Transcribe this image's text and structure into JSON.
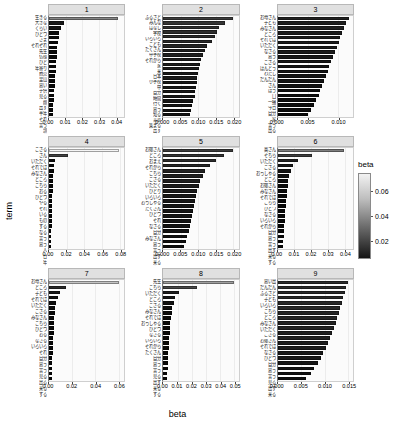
{
  "chart_data": {
    "type": "bar",
    "title": "",
    "xlabel": "beta",
    "ylabel": "term",
    "orientation": "horizontal",
    "facet_variable": "topic",
    "legend": {
      "title": "beta",
      "position": "right",
      "type": "continuous-colorbar",
      "ticks": [
        0.02,
        0.04,
        0.06
      ],
      "tick_labels": [
        "0.02",
        "0.04",
        "0.06"
      ],
      "low_color": "#000000",
      "high_color": "#ffffff",
      "range": [
        0.005,
        0.075
      ]
    },
    "panels": [
      {
        "label": "1",
        "xlim": [
          0,
          0.045
        ],
        "ticks": [
          0,
          0.01,
          0.02,
          0.03,
          0.04
        ],
        "tick_labels": [
          "0.00",
          "0.01",
          "0.02",
          "0.03",
          "0.04"
        ],
        "categories": [
          "生きる",
          "大きな",
          "くらい",
          "ひとつ",
          "さま",
          "それぞれ",
          "先生",
          "仏様",
          "ひと",
          "年寄り",
          "商売",
          "里山",
          "思い",
          "子供",
          "見る",
          "顔",
          "出す",
          "半年",
          "それ",
          "言う",
          "頭"
        ],
        "values": [
          0.0415,
          0.0092,
          0.0072,
          0.0062,
          0.0057,
          0.0053,
          0.005,
          0.0047,
          0.0045,
          0.0043,
          0.0041,
          0.0039,
          0.0037,
          0.0035,
          0.0033,
          0.0031,
          0.0029,
          0.0028,
          0.0026,
          0.0025,
          0.0024
        ]
      },
      {
        "label": "2",
        "xlim": [
          0,
          0.0215
        ],
        "ticks": [
          0,
          0.005,
          0.01,
          0.015,
          0.02
        ],
        "tick_labels": [
          "0.000",
          "0.005",
          "0.010",
          "0.015",
          "0.020"
        ],
        "categories": [
          "ふるさと",
          "みんな",
          "はなし",
          "学校",
          "いろいろ",
          "こども",
          "たくさん",
          "中学校",
          "それから",
          "家",
          "来",
          "日本",
          "小学校",
          "中",
          "自分",
          "時間",
          "行く",
          "思う",
          "知る",
          "言葉",
          "集まる",
          "出す"
        ],
        "values": [
          0.02,
          0.0177,
          0.016,
          0.0152,
          0.0148,
          0.014,
          0.0125,
          0.0118,
          0.0112,
          0.0108,
          0.0104,
          0.0101,
          0.0099,
          0.0097,
          0.0095,
          0.0093,
          0.0091,
          0.0089,
          0.0086,
          0.0083,
          0.008,
          0.0077
        ]
      },
      {
        "label": "3",
        "xlim": [
          0,
          0.0125
        ],
        "ticks": [
          0,
          0.005,
          0.01
        ],
        "tick_labels": [
          "0.000",
          "0.005",
          "0.010"
        ],
        "categories": [
          "お母さん",
          "子ども",
          "みなさん",
          "ところ",
          "それでは",
          "いただく",
          "なさる",
          "思う",
          "ござる",
          "ほんとう",
          "わたし",
          "だんだん",
          "さん",
          "ほう",
          "口",
          "一緒",
          "今日",
          "自分",
          "家",
          "言う",
          "出る"
        ],
        "values": [
          0.0118,
          0.0114,
          0.011,
          0.0107,
          0.0104,
          0.0101,
          0.0098,
          0.0095,
          0.0092,
          0.0089,
          0.0086,
          0.0083,
          0.008,
          0.0077,
          0.0074,
          0.0071,
          0.0068,
          0.0064,
          0.006,
          0.0055,
          0.005
        ]
      },
      {
        "label": "4",
        "xlim": [
          0,
          0.085
        ],
        "ticks": [
          0,
          0.02,
          0.04,
          0.06,
          0.08
        ],
        "tick_labels": [
          "0.00",
          "0.02",
          "0.04",
          "0.06",
          "0.08"
        ],
        "categories": [
          "ござる",
          "さん",
          "いただく",
          "それでは",
          "みなさん",
          "ところ",
          "こちら",
          "おる",
          "ひとつ",
          "やる",
          "それ",
          "いる",
          "もの",
          "する",
          "なる",
          "言う",
          "思う",
          "人",
          "日",
          "年"
        ],
        "values": [
          0.079,
          0.0215,
          0.0072,
          0.0058,
          0.0051,
          0.0047,
          0.0044,
          0.0042,
          0.004,
          0.0038,
          0.0036,
          0.0034,
          0.0033,
          0.0031,
          0.003,
          0.0029,
          0.0028,
          0.0027,
          0.0026,
          0.0025
        ]
      },
      {
        "label": "5",
        "xlim": [
          0,
          0.0215
        ],
        "ticks": [
          0,
          0.005,
          0.01,
          0.015,
          0.02
        ],
        "tick_labels": [
          "0.000",
          "0.005",
          "0.010",
          "0.015",
          "0.020"
        ],
        "categories": [
          "お嬢さん",
          "ところ",
          "おまえ",
          "それから",
          "こちら",
          "ござる",
          "いただく",
          "ひとり",
          "いろいろ",
          "おっしゃる",
          "たくさん",
          "ひとつ",
          "それ",
          "なさる",
          "自分",
          "みなさん",
          "思う",
          "言う",
          "出す",
          "来る"
        ],
        "values": [
          0.02,
          0.0172,
          0.015,
          0.0132,
          0.012,
          0.0112,
          0.0106,
          0.0101,
          0.0097,
          0.0093,
          0.009,
          0.0087,
          0.0084,
          0.0081,
          0.0078,
          0.0075,
          0.0072,
          0.0068,
          0.0064,
          0.0058
        ]
      },
      {
        "label": "6",
        "xlim": [
          0,
          0.045
        ],
        "ticks": [
          0,
          0.01,
          0.02,
          0.03,
          0.04
        ],
        "tick_labels": [
          "0.00",
          "0.01",
          "0.02",
          "0.03",
          "0.04"
        ],
        "categories": [
          "奥さん",
          "そちら",
          "いただく",
          "ござる",
          "おっしゃる",
          "ところ",
          "お嬢さん",
          "みなさん",
          "それでは",
          "こちら",
          "ひとつ",
          "なさる",
          "いろいろ",
          "それから",
          "自分",
          "思う",
          "言う",
          "出す",
          "来る",
          "する"
        ],
        "values": [
          0.0395,
          0.0205,
          0.012,
          0.0092,
          0.0078,
          0.007,
          0.0064,
          0.006,
          0.0056,
          0.0053,
          0.005,
          0.0047,
          0.0045,
          0.0043,
          0.0041,
          0.0039,
          0.0037,
          0.0035,
          0.0032,
          0.0029
        ]
      },
      {
        "label": "7",
        "xlim": [
          0,
          0.065
        ],
        "ticks": [
          0,
          0.02,
          0.04,
          0.06
        ],
        "tick_labels": [
          "0.00",
          "0.02",
          "0.04",
          "0.06"
        ],
        "categories": [
          "お母さん",
          "ところ",
          "子ども",
          "それでは",
          "いただく",
          "ござる",
          "みなさん",
          "こちら",
          "ひとつ",
          "おる",
          "なさる",
          "いろいろ",
          "それ",
          "自分",
          "思う",
          "言う",
          "見る",
          "出る",
          "来る",
          "する"
        ],
        "values": [
          0.06,
          0.0145,
          0.0095,
          0.0074,
          0.0063,
          0.0056,
          0.0051,
          0.0047,
          0.0044,
          0.0041,
          0.0039,
          0.0037,
          0.0035,
          0.0033,
          0.0031,
          0.003,
          0.0028,
          0.0027,
          0.0025,
          0.0024
        ]
      },
      {
        "label": "8",
        "xlim": [
          0,
          0.053
        ],
        "ticks": [
          0,
          0.01,
          0.02,
          0.03,
          0.04,
          0.05
        ],
        "tick_labels": [
          "0.00",
          "0.01",
          "0.02",
          "0.03",
          "0.04",
          "0.05"
        ],
        "categories": [
          "先生",
          "こちら",
          "いただく",
          "ところ",
          "ござる",
          "みなさん",
          "それでは",
          "おっしゃる",
          "ひとつ",
          "なさる",
          "いろいろ",
          "それから",
          "たくさん",
          "自分",
          "思う",
          "言う",
          "見る",
          "出す",
          "来る",
          "する"
        ],
        "values": [
          0.0495,
          0.0235,
          0.0108,
          0.0084,
          0.0072,
          0.0064,
          0.0058,
          0.0054,
          0.005,
          0.0047,
          0.0044,
          0.0042,
          0.004,
          0.0038,
          0.0036,
          0.0034,
          0.0032,
          0.003,
          0.0028,
          0.0026
        ]
      },
      {
        "label": "9",
        "xlim": [
          0,
          0.016
        ],
        "ticks": [
          0,
          0.005,
          0.01,
          0.015
        ],
        "tick_labels": [
          "0.000",
          "0.005",
          "0.010",
          "0.015"
        ],
        "categories": [
          "思い出",
          "だんだん",
          "ふるさと",
          "子ども",
          "いろいろ",
          "こちら",
          "ところ",
          "みなさん",
          "いただく",
          "ござる",
          "お嬢さん",
          "それでは",
          "なさる",
          "ひとつ",
          "自分",
          "思う",
          "言う",
          "見る",
          "出す",
          "来る"
        ],
        "values": [
          0.015,
          0.0146,
          0.0142,
          0.0139,
          0.0136,
          0.0133,
          0.013,
          0.0127,
          0.0124,
          0.012,
          0.0116,
          0.0112,
          0.0107,
          0.0102,
          0.0097,
          0.0091,
          0.0085,
          0.0078,
          0.007,
          0.006
        ]
      }
    ]
  }
}
